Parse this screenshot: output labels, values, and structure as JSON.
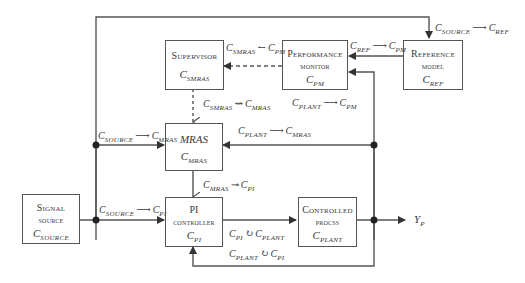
{
  "blocks": {
    "supervisor": {
      "title": "Supervisor",
      "symbol": "C",
      "sub": "SMRAS"
    },
    "performance_monitor": {
      "title1": "Performance",
      "title2": "monitor",
      "symbol": "C",
      "sub": "PM"
    },
    "reference_model": {
      "title1": "Reference",
      "title2": "model",
      "symbol": "C",
      "sub": "REF"
    },
    "mras": {
      "title": "MRAS",
      "symbol": "C",
      "sub": "MRAS"
    },
    "signal_source": {
      "title1": "Signal",
      "title2": "source",
      "symbol": "C",
      "sub": "SOURCE"
    },
    "pi_controller": {
      "title1": "PI",
      "title2": "controller",
      "symbol": "C",
      "sub": "PI"
    },
    "controlled_process": {
      "title1": "Controlled",
      "title2": "procss",
      "symbol": "C",
      "sub": "PLANT"
    }
  },
  "connections": {
    "source_ref": {
      "from": "SOURCE",
      "op": "⟶",
      "to": "REF"
    },
    "smras_pm": {
      "from": "SMRAS",
      "op": "↼",
      "to": "PM"
    },
    "ref_pm": {
      "from": "REF",
      "op": "⟶",
      "to": "PM"
    },
    "smras_mras": {
      "from": "SMRAS",
      "op": "⇝",
      "to": "MRAS"
    },
    "plant_pm": {
      "from": "PLANT",
      "op": "⟶",
      "to": "PM"
    },
    "source_mras": {
      "from": "SOURCE",
      "op": "⟶",
      "to": "MRAS"
    },
    "plant_mras": {
      "from": "PLANT",
      "op": "⟶",
      "to": "MRAS"
    },
    "mras_pi": {
      "from": "MRAS",
      "op": "⊸",
      "to": "PI"
    },
    "source_pi": {
      "from": "SOURCE",
      "op": "⟶",
      "to": "PI"
    },
    "pi_plant": {
      "from": "PI",
      "op": "↻",
      "to": "PLANT"
    },
    "plant_pi": {
      "from": "PLANT",
      "op": "↻",
      "to": "PI"
    }
  },
  "output": {
    "symbol": "Y",
    "sub": "P"
  },
  "colors": {
    "line": "#555555",
    "text": "#3a3a3a"
  }
}
